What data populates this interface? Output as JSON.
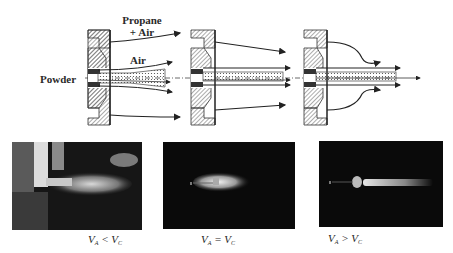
{
  "labels": {
    "propane_line1": "Propane",
    "propane_line2": "+ Air",
    "air": "Air",
    "powder": "Powder"
  },
  "nozzles": [
    {
      "id": "nozzle-1",
      "flow": "converging powder jet surrounded by diverging air and propane+air streams"
    },
    {
      "id": "nozzle-2",
      "flow": "parallel powder jet with straight air streams"
    },
    {
      "id": "nozzle-3",
      "flow": "bulging propane+air envelope with narrow straight powder jet"
    }
  ],
  "photos": [
    {
      "condition_v": "V",
      "condition_a": "A",
      "operator": "<",
      "condition_v2": "V",
      "condition_c": "C",
      "desc": "flame with bright diffuse plume, lit background"
    },
    {
      "condition_v": "V",
      "condition_a": "A",
      "operator": "=",
      "condition_v2": "V",
      "condition_c": "C",
      "desc": "compact bright flame near nozzle on dark background"
    },
    {
      "condition_v": "V",
      "condition_a": "A",
      "operator": ">",
      "condition_v2": "V",
      "condition_c": "C",
      "desc": "long narrow flame jet on dark background"
    }
  ],
  "colors": {
    "ink": "#2a2a2a",
    "hatch": "#555555",
    "photo_bg": "#0a0a0a"
  }
}
